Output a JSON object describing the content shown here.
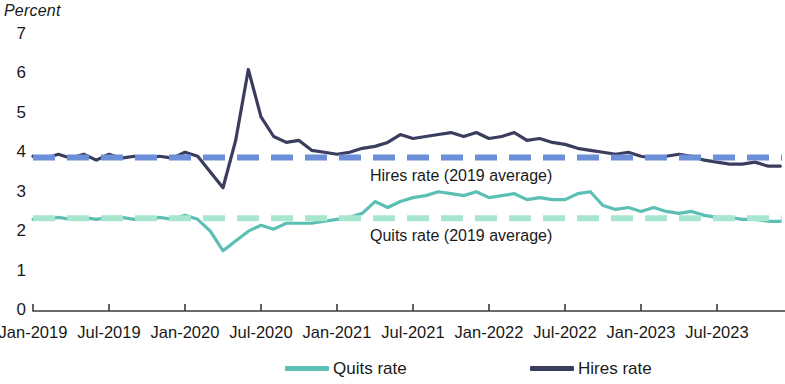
{
  "chart_data": {
    "type": "line",
    "title": "",
    "ylabel": "Percent",
    "xlabel": "",
    "ylim": [
      0,
      7
    ],
    "yticks": [
      0,
      1,
      2,
      3,
      4,
      5,
      6,
      7
    ],
    "ytick_labels": [
      "0",
      "1",
      "2",
      "3",
      "4",
      "5",
      "6",
      "7"
    ],
    "grid": false,
    "legend_position": "bottom",
    "xtick_labels": [
      "Jan-2019",
      "Jul-2019",
      "Jan-2020",
      "Jul-2020",
      "Jan-2021",
      "Jul-2021",
      "Jan-2022",
      "Jul-2022",
      "Jan-2023",
      "Jul-2023"
    ],
    "x": [
      "Jan-2019",
      "Feb-2019",
      "Mar-2019",
      "Apr-2019",
      "May-2019",
      "Jun-2019",
      "Jul-2019",
      "Aug-2019",
      "Sep-2019",
      "Oct-2019",
      "Nov-2019",
      "Dec-2019",
      "Jan-2020",
      "Feb-2020",
      "Mar-2020",
      "Apr-2020",
      "May-2020",
      "Jun-2020",
      "Jul-2020",
      "Aug-2020",
      "Sep-2020",
      "Oct-2020",
      "Nov-2020",
      "Dec-2020",
      "Jan-2021",
      "Feb-2021",
      "Mar-2021",
      "Apr-2021",
      "May-2021",
      "Jun-2021",
      "Jul-2021",
      "Aug-2021",
      "Sep-2021",
      "Oct-2021",
      "Nov-2021",
      "Dec-2021",
      "Jan-2022",
      "Feb-2022",
      "Mar-2022",
      "Apr-2022",
      "May-2022",
      "Jun-2022",
      "Jul-2022",
      "Aug-2022",
      "Sep-2022",
      "Oct-2022",
      "Nov-2022",
      "Dec-2022",
      "Jan-2023",
      "Feb-2023",
      "Mar-2023",
      "Apr-2023",
      "May-2023",
      "Jun-2023",
      "Jul-2023",
      "Aug-2023",
      "Sep-2023",
      "Oct-2023",
      "Nov-2023",
      "Dec-2023"
    ],
    "series": [
      {
        "name": "Hires rate",
        "color": "#3b3d5e",
        "values": [
          3.9,
          3.85,
          3.95,
          3.85,
          3.95,
          3.8,
          3.95,
          3.85,
          3.9,
          3.85,
          3.9,
          3.85,
          4.0,
          3.9,
          3.5,
          3.1,
          4.3,
          6.1,
          4.9,
          4.4,
          4.25,
          4.3,
          4.05,
          4.0,
          3.95,
          4.0,
          4.1,
          4.15,
          4.25,
          4.45,
          4.35,
          4.4,
          4.45,
          4.5,
          4.4,
          4.5,
          4.35,
          4.4,
          4.5,
          4.3,
          4.35,
          4.25,
          4.2,
          4.1,
          4.05,
          4.0,
          3.95,
          4.0,
          3.9,
          3.85,
          3.9,
          3.95,
          3.9,
          3.8,
          3.75,
          3.7,
          3.7,
          3.75,
          3.65,
          3.65
        ]
      },
      {
        "name": "Quits rate",
        "color": "#5cbfb4",
        "values": [
          2.3,
          2.3,
          2.35,
          2.3,
          2.35,
          2.3,
          2.35,
          2.35,
          2.3,
          2.3,
          2.35,
          2.3,
          2.4,
          2.3,
          2.0,
          1.5,
          1.75,
          2.0,
          2.15,
          2.05,
          2.2,
          2.2,
          2.2,
          2.25,
          2.3,
          2.35,
          2.45,
          2.75,
          2.6,
          2.75,
          2.85,
          2.9,
          3.0,
          2.95,
          2.9,
          3.0,
          2.85,
          2.9,
          2.95,
          2.8,
          2.85,
          2.8,
          2.8,
          2.95,
          3.0,
          2.65,
          2.55,
          2.6,
          2.5,
          2.6,
          2.5,
          2.45,
          2.5,
          2.4,
          2.35,
          2.35,
          2.3,
          2.3,
          2.25,
          2.25
        ]
      }
    ],
    "reference_lines": [
      {
        "name": "Hires rate (2019 average)",
        "value": 3.87,
        "color": "#6b8fd8",
        "style": "dashed"
      },
      {
        "name": "Quits rate (2019 average)",
        "value": 2.33,
        "color": "#a8e6cf",
        "style": "dashed"
      }
    ],
    "annotations": [
      {
        "text": "Hires rate (2019 average)",
        "x_px": 370,
        "y_px": 168
      },
      {
        "text": "Quits rate (2019 average)",
        "x_px": 370,
        "y_px": 228
      }
    ],
    "legend": [
      {
        "label": "Quits rate",
        "color": "#5cbfb4"
      },
      {
        "label": "Hires rate",
        "color": "#3b3d5e"
      }
    ]
  }
}
